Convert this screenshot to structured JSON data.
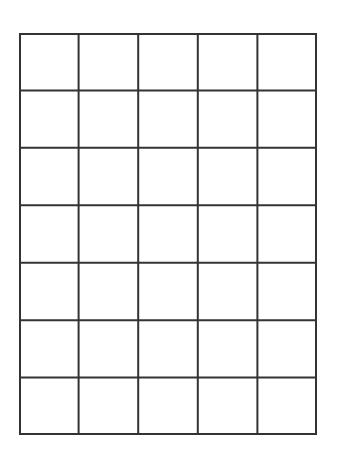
{
  "grid": {
    "columns": 5,
    "rows": 7,
    "line_color": "#333333",
    "background": "#ffffff",
    "cells": [
      [
        "",
        "",
        "",
        "",
        ""
      ],
      [
        "",
        "",
        "",
        "",
        ""
      ],
      [
        "",
        "",
        "",
        "",
        ""
      ],
      [
        "",
        "",
        "",
        "",
        ""
      ],
      [
        "",
        "",
        "",
        "",
        ""
      ],
      [
        "",
        "",
        "",
        "",
        ""
      ],
      [
        "",
        "",
        "",
        "",
        ""
      ]
    ]
  }
}
